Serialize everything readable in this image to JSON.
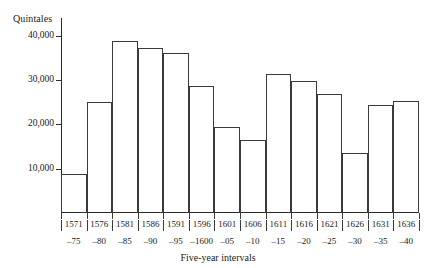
{
  "chart_data": {
    "type": "bar",
    "title": "",
    "xlabel": "Five-year intervals",
    "ylabel": "Quintales",
    "ylim": [
      0,
      44000
    ],
    "ytick_values": [
      10000,
      20000,
      30000,
      40000
    ],
    "ytick_labels": [
      "10,000",
      "20,000",
      "30,000",
      "40,000"
    ],
    "grid": false,
    "legend": null,
    "categories": [
      "1571-75",
      "1576-80",
      "1581-85",
      "1586-90",
      "1591-95",
      "1596-1600",
      "1601-05",
      "1606-10",
      "1611-15",
      "1616-20",
      "1621-25",
      "1626-30",
      "1631-35",
      "1636-40"
    ],
    "category_parts": [
      {
        "start": "1571",
        "end": "–75"
      },
      {
        "start": "1576",
        "end": "–80"
      },
      {
        "start": "1581",
        "end": "–85"
      },
      {
        "start": "1586",
        "end": "–90"
      },
      {
        "start": "1591",
        "end": "–95"
      },
      {
        "start": "1596",
        "end": "–1600"
      },
      {
        "start": "1601",
        "end": "–05"
      },
      {
        "start": "1606",
        "end": "–10"
      },
      {
        "start": "1611",
        "end": "–15"
      },
      {
        "start": "1616",
        "end": "–20"
      },
      {
        "start": "1621",
        "end": "–25"
      },
      {
        "start": "1626",
        "end": "–30"
      },
      {
        "start": "1631",
        "end": "–35"
      },
      {
        "start": "1636",
        "end": "–40"
      }
    ],
    "values": [
      8700,
      25000,
      38800,
      37200,
      36100,
      28600,
      19500,
      16500,
      31300,
      29700,
      26800,
      13500,
      24300,
      25200
    ],
    "bar_style": {
      "fill": "none",
      "stroke": "#3a3a3a"
    }
  }
}
